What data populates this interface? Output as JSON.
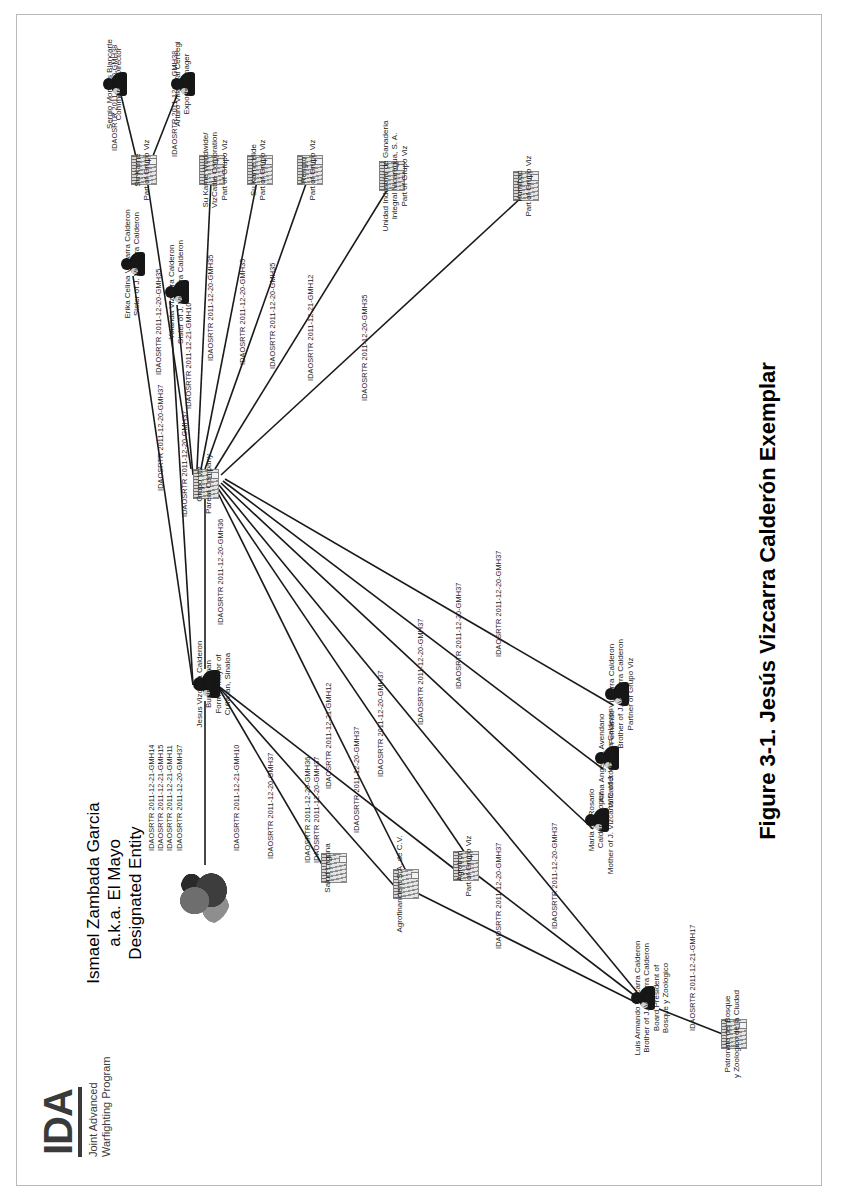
{
  "page": {
    "logo": {
      "acronym": "IDA",
      "subtitle_line1": "Joint Advanced",
      "subtitle_line2": "Warfighting Program"
    },
    "caption": "Figure 3-1. Jesús Vizcarra Calderón Exemplar"
  },
  "headline": {
    "line1": "Ismael Zambada Garcia",
    "line2": "a.k.a. El Mayo",
    "line3": "Designated Entity"
  },
  "nodes": [
    {
      "id": "zambada",
      "type": "photo",
      "label": ""
    },
    {
      "id": "jesus",
      "type": "person",
      "label": "Jesus Vizcarra Calderon\nBusinessman\nFormer Mayor of\nCuliacan, Sinaloa"
    },
    {
      "id": "grupoviz",
      "type": "company",
      "label": "Grupo Viz\nParent Company"
    },
    {
      "id": "erika",
      "type": "person",
      "label": "Erika Celina Vizcarra Calderon\nSister of J. Vizcarra Calderon"
    },
    {
      "id": "yolanda",
      "type": "person",
      "label": "Yolanda Vizcarra Calderon\nSister of J. Vizcarra Calderon"
    },
    {
      "id": "sukarne",
      "type": "company",
      "label": "Su Karne\nPart of Grupo Viz"
    },
    {
      "id": "sergio",
      "type": "person",
      "label": "Sergio Morales Blancarte\nCommercial Director"
    },
    {
      "id": "arturo",
      "type": "person",
      "label": "Arturo Villarreal Cereegi\nExports Manager"
    },
    {
      "id": "sukww",
      "type": "company",
      "label": "Su Karne Worldwide/\nVizCattle Corporation\nPart of Grupo Viz"
    },
    {
      "id": "sukhide",
      "type": "company",
      "label": "Su Karne Hide\nPart of Grupo Viz"
    },
    {
      "id": "rengro",
      "type": "company",
      "label": "Rengro\nPart of Grupo Viz"
    },
    {
      "id": "unidad",
      "type": "company",
      "label": "Unidad Industrial de Ganaderia\nIntegral Nicaragua, S. A.\nPart of Grupo Viz"
    },
    {
      "id": "humibac",
      "type": "company",
      "label": "Humibac\nPart of Grupo Viz"
    },
    {
      "id": "fernando",
      "type": "person",
      "label": "Fernando Vizcarra Calderon\nBrother of J. Vizcarra Calderon\nPartner of Grupo Viz"
    },
    {
      "id": "alma",
      "type": "person",
      "label": "Alma Angelina Avendano\nWife of J. Vizcarra Calderon"
    },
    {
      "id": "maria",
      "type": "person",
      "label": "Maria del Rosario\nCalderon Lopez\nMother of J. Vizcarra Calderon"
    },
    {
      "id": "luis",
      "type": "person",
      "label": "Luis Armando Vizcarra Calderon\nBrother of J. Vizcarra Calderon\nBoard President of\nBosque y Zoologico"
    },
    {
      "id": "patronato",
      "type": "company",
      "label": "Patronato del Bosque\ny Zoologico de la Ciudad"
    },
    {
      "id": "agrotron",
      "type": "company",
      "label": "Agrotron\nPart of Grupo Viz"
    },
    {
      "id": "agrofin",
      "type": "company",
      "label": "Agrofinanciera S.A. de C.V."
    },
    {
      "id": "salud",
      "type": "company",
      "label": "Salud Laguna"
    }
  ],
  "edge_labels": [
    {
      "id": "e-zambada-jesus",
      "lines": [
        "IDAOSRTR 2011-12-21-GMH14",
        "IDAOSRTR 2011-12-21-GMH15",
        "IDAOSRTR 2011-12-21-GMH11",
        "IDAOSRTR 2011-12-20-GMH37"
      ]
    },
    {
      "id": "e-jesus-erika",
      "lines": [
        "IDAOSRTR 2011-12-20-GMH37"
      ]
    },
    {
      "id": "e-jesus-yolanda",
      "lines": [
        "IDAOSRTR 2011-12-20-GMH37"
      ]
    },
    {
      "id": "e-jesus-grupo",
      "lines": [
        "IDAOSRTR 2011-12-20-GMH36"
      ]
    },
    {
      "id": "e-grupo-yolanda",
      "lines": [
        "IDAOSRTR 2011-12-21-GMH10"
      ]
    },
    {
      "id": "e-grupo-sukarne",
      "lines": [
        "IDAOSRTR 2011-12-20-GMH35"
      ]
    },
    {
      "id": "e-sukarne-sergio",
      "lines": [
        "IDAOSRTR 2011-12-20-GMH38"
      ]
    },
    {
      "id": "e-sukarne-arturo",
      "lines": [
        "IDAOSRTR 2011-12-20-GMH38"
      ]
    },
    {
      "id": "e-grupo-sukww",
      "lines": [
        "IDAOSRTR 2011-12-20-GMH35"
      ]
    },
    {
      "id": "e-grupo-sukhide",
      "lines": [
        "IDAOSRTR 2011-12-20-GMH35"
      ]
    },
    {
      "id": "e-grupo-rengro",
      "lines": [
        "IDAOSRTR 2011-12-20-GMH35"
      ]
    },
    {
      "id": "e-grupo-unidad",
      "lines": [
        "IDAOSRTR 2011-12-21-GMH12"
      ]
    },
    {
      "id": "e-grupo-humibac",
      "lines": [
        "IDAOSRTR 2011-12-20-GMH35"
      ]
    },
    {
      "id": "e-grupo-fernando",
      "lines": [
        "IDAOSRTR 2011-12-20-GMH37"
      ]
    },
    {
      "id": "e-grupo-alma",
      "lines": [
        "IDAOSRTR 2011-12-20-GMH37"
      ]
    },
    {
      "id": "e-grupo-maria",
      "lines": [
        "IDAOSRTR 2011-12-20-GMH37"
      ]
    },
    {
      "id": "e-grupo-luis",
      "lines": [
        "IDAOSRTR 2011-12-20-GMH37"
      ]
    },
    {
      "id": "e-luis-patronato",
      "lines": [
        "IDAOSRTR 2011-12-21-GMH17"
      ]
    },
    {
      "id": "e-grupo-agrotron",
      "lines": [
        "IDAOSRTR 2011-12-21-GMH12"
      ]
    },
    {
      "id": "e-jesus-agrotron",
      "lines": [
        "IDAOSRTR 2011-12-20-GMH36",
        "IDAOSRTR 2011-12-20-GMH37"
      ]
    },
    {
      "id": "e-jesus-agrofin",
      "lines": [
        "IDAOSRTR 2011-12-20-GMH37"
      ]
    },
    {
      "id": "e-jesus-salud",
      "lines": [
        "IDAOSRTR 2011-12-21-GMH10"
      ]
    },
    {
      "id": "e-agrofin-luis",
      "lines": [
        "IDAOSRTR 2011-12-20-GMH37"
      ]
    },
    {
      "id": "e-agrotron-luis",
      "lines": [
        "IDAOSRTR 2011-12-20-GMH37"
      ]
    },
    {
      "id": "e-grupo-agrofin",
      "lines": [
        "IDAOSRTR 2011-12-20-GMH37"
      ]
    }
  ]
}
